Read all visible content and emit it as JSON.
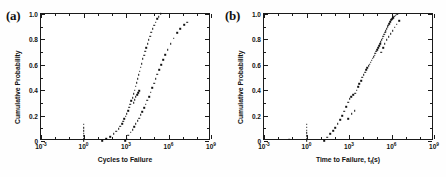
{
  "figure": {
    "panels": [
      {
        "label": "(a)",
        "xlabel": "Cycles to Failure",
        "ylabel": "Cumulative Probability"
      },
      {
        "label": "(b)",
        "xlabel_pre": "Time to Failure,  t",
        "xlabel_sub": "f",
        "xlabel_post": "(s)",
        "ylabel": "Cumulative Probability"
      }
    ],
    "xticks": [
      "-3",
      "0",
      "3",
      "6",
      "9"
    ],
    "yticks": [
      "0",
      "0.2",
      "0.4",
      "0.6",
      "0.8",
      "1.0"
    ],
    "marker_color": "#111111",
    "axis_color": "#1a1a1a"
  },
  "chart_data": [
    {
      "type": "scatter",
      "title": "(a)",
      "xlabel": "Cycles to Failure",
      "ylabel": "Cumulative Probability",
      "xscale": "log",
      "xlim": [
        0.001,
        1000000000
      ],
      "ylim": [
        0,
        1.0
      ],
      "xtick_labels": [
        "10^-3",
        "10^0",
        "10^3",
        "10^6",
        "10^9"
      ],
      "ytick_labels": [
        "0",
        "0.2",
        "0.4",
        "0.6",
        "0.8",
        "1.0"
      ],
      "grid": false,
      "legend": "none",
      "series": [
        {
          "name": "left vertical cluster at 1 cycle",
          "x": [
            1.0,
            1.0,
            1.0,
            1.0,
            1.0,
            1.0,
            1.0
          ],
          "y": [
            0.0,
            0.018,
            0.04,
            0.062,
            0.082,
            0.105,
            0.13
          ]
        },
        {
          "name": "middle distribution",
          "x": [
            20,
            40,
            75,
            140,
            210,
            300,
            400,
            520,
            640,
            780,
            950,
            1150,
            1400,
            1700,
            2000,
            2400,
            2900,
            3400,
            4000,
            4800,
            5600,
            6600,
            7800,
            9200,
            11000,
            13000,
            15500,
            18500,
            22000,
            27000,
            33000,
            40000,
            50000,
            62000,
            78000,
            98000,
            125000,
            160000,
            210000,
            290000
          ],
          "y": [
            0.0,
            0.015,
            0.035,
            0.055,
            0.075,
            0.095,
            0.115,
            0.135,
            0.155,
            0.175,
            0.195,
            0.215,
            0.24,
            0.265,
            0.29,
            0.315,
            0.34,
            0.37,
            0.4,
            0.43,
            0.46,
            0.49,
            0.52,
            0.55,
            0.58,
            0.61,
            0.645,
            0.675,
            0.705,
            0.735,
            0.765,
            0.795,
            0.825,
            0.855,
            0.885,
            0.91,
            0.935,
            0.96,
            0.98,
            1.0
          ]
        },
        {
          "name": "middle upper branch",
          "x": [
            3400,
            4200,
            5000,
            6000,
            7200,
            8600
          ],
          "y": [
            0.3,
            0.325,
            0.35,
            0.365,
            0.38,
            0.395
          ]
        },
        {
          "name": "right distribution",
          "x": [
            850,
            1100,
            1500,
            2100,
            2900,
            3800,
            5000,
            6500,
            8500,
            11000,
            14500,
            19000,
            25000,
            32000,
            42000,
            55000,
            72000,
            95000,
            125000,
            165000,
            220000,
            300000,
            420000,
            600000,
            900000,
            1400000,
            2300000,
            4000000,
            7000000,
            13000000,
            20000000
          ],
          "y": [
            0.0,
            0.022,
            0.045,
            0.068,
            0.09,
            0.112,
            0.135,
            0.158,
            0.18,
            0.205,
            0.232,
            0.26,
            0.29,
            0.32,
            0.35,
            0.385,
            0.42,
            0.455,
            0.49,
            0.525,
            0.56,
            0.6,
            0.64,
            0.68,
            0.72,
            0.765,
            0.81,
            0.85,
            0.885,
            0.915,
            0.935
          ]
        }
      ]
    },
    {
      "type": "scatter",
      "title": "(b)",
      "xlabel": "Time to Failure, tf(s)",
      "ylabel": "Cumulative Probability",
      "xscale": "log",
      "xlim": [
        0.001,
        1000000000
      ],
      "ylim": [
        0,
        1.0
      ],
      "xtick_labels": [
        "10^-3",
        "10^0",
        "10^3",
        "10^6",
        "10^9"
      ],
      "ytick_labels": [
        "0",
        "0.2",
        "0.4",
        "0.6",
        "0.8",
        "1.0"
      ],
      "grid": false,
      "legend": "none",
      "series": [
        {
          "name": "isolated low point",
          "x": [
            0.06
          ],
          "y": [
            0.012
          ]
        },
        {
          "name": "vertical cluster at 1 s",
          "x": [
            1.0,
            1.0,
            1.0,
            1.0,
            1.0,
            1.0,
            1.0
          ],
          "y": [
            0.0,
            0.02,
            0.042,
            0.063,
            0.085,
            0.107,
            0.13
          ]
        },
        {
          "name": "lower branch",
          "x": [
            18,
            30,
            48,
            75,
            110,
            160,
            230,
            330,
            460,
            640,
            900
          ],
          "y": [
            0.0,
            0.028,
            0.055,
            0.08,
            0.105,
            0.135,
            0.165,
            0.2,
            0.235,
            0.27,
            0.305
          ]
        },
        {
          "name": "lower branch upper tail",
          "x": [
            1100,
            1500,
            2000,
            2700
          ],
          "y": [
            0.33,
            0.35,
            0.365,
            0.375
          ]
        },
        {
          "name": "sparse mid points",
          "x": [
            900,
            1600,
            2600
          ],
          "y": [
            0.175,
            0.215,
            0.24
          ]
        },
        {
          "name": "main steep distribution",
          "x": [
            3500,
            4400,
            5500,
            7000,
            8800,
            11000,
            13500,
            16500,
            20000,
            24000,
            29000,
            34000,
            40000,
            47000,
            55000,
            64000,
            74000,
            86000,
            100000,
            115000,
            133000,
            153000,
            176000,
            202000,
            232000,
            266000,
            305000,
            350000,
            400000,
            460000,
            530000,
            610000,
            700000,
            810000,
            940000,
            1100000,
            1300000,
            1600000,
            2000000,
            2600000
          ],
          "y": [
            0.4,
            0.425,
            0.45,
            0.475,
            0.5,
            0.52,
            0.54,
            0.56,
            0.575,
            0.59,
            0.605,
            0.62,
            0.635,
            0.65,
            0.662,
            0.675,
            0.69,
            0.705,
            0.72,
            0.735,
            0.75,
            0.765,
            0.78,
            0.795,
            0.81,
            0.825,
            0.84,
            0.855,
            0.87,
            0.885,
            0.9,
            0.912,
            0.925,
            0.94,
            0.952,
            0.962,
            0.972,
            0.982,
            0.99,
            0.998
          ]
        },
        {
          "name": "right offset branch",
          "x": [
            180000,
            250000,
            340000,
            460000,
            620000,
            850000,
            1200000,
            1700000,
            2400000,
            3400000
          ],
          "y": [
            0.7,
            0.735,
            0.765,
            0.795,
            0.82,
            0.845,
            0.87,
            0.895,
            0.92,
            0.945
          ]
        }
      ]
    }
  ]
}
